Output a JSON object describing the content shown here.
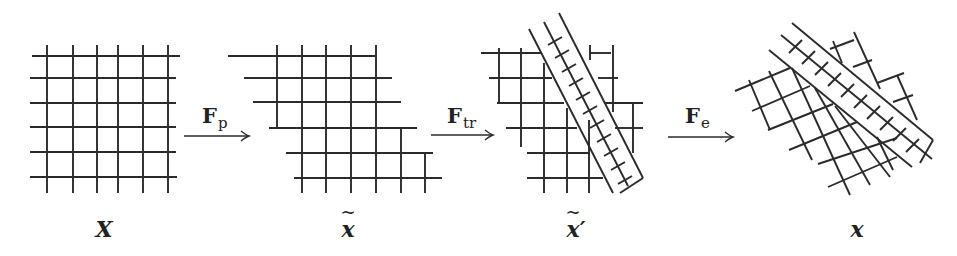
{
  "diagram": {
    "stroke_color": "#2b2b2b",
    "background": "#ffffff",
    "stages": [
      {
        "id": "X",
        "label": "X",
        "tilde": false,
        "prime": "",
        "label_pos": [
          104,
          216
        ],
        "lines": [
          [
            47,
            45,
            47,
            193
          ],
          [
            73,
            45,
            73,
            193
          ],
          [
            97,
            45,
            97,
            193
          ],
          [
            118,
            45,
            118,
            193
          ],
          [
            143,
            45,
            143,
            193
          ],
          [
            168,
            45,
            168,
            193
          ],
          [
            32,
            56,
            180,
            56
          ],
          [
            30,
            78,
            176,
            78
          ],
          [
            30,
            103,
            176,
            103
          ],
          [
            30,
            127,
            176,
            127
          ],
          [
            30,
            152,
            176,
            152
          ],
          [
            30,
            177,
            177,
            177
          ]
        ]
      },
      {
        "id": "x_tilde",
        "label": "x",
        "tilde": true,
        "prime": "",
        "label_pos": [
          348,
          216
        ],
        "lines": [
          [
            228,
            56,
            375,
            56
          ],
          [
            244,
            78,
            392,
            78
          ],
          [
            253,
            102,
            401,
            102
          ],
          [
            269,
            128,
            417,
            128
          ],
          [
            286,
            153,
            433,
            153
          ],
          [
            294,
            178,
            442,
            178
          ],
          [
            277,
            45,
            277,
            128
          ],
          [
            302,
            45,
            302,
            193
          ],
          [
            326,
            45,
            326,
            193
          ],
          [
            351,
            45,
            351,
            193
          ],
          [
            376,
            45,
            376,
            193
          ],
          [
            401,
            128,
            401,
            193
          ],
          [
            425,
            153,
            425,
            193
          ]
        ]
      },
      {
        "id": "x_tilde_prime",
        "label": "x",
        "tilde": true,
        "prime": "′",
        "label_pos": [
          576,
          216
        ],
        "lines": [
          [
            481,
            53,
            541,
            53
          ],
          [
            590,
            53,
            611,
            53
          ],
          [
            489,
            78,
            552,
            78
          ],
          [
            598,
            78,
            618,
            78
          ],
          [
            497,
            103,
            564,
            103
          ],
          [
            605,
            103,
            643,
            103
          ],
          [
            506,
            128,
            577,
            128
          ],
          [
            615,
            128,
            643,
            128
          ],
          [
            527,
            153,
            590,
            153
          ],
          [
            527,
            178,
            603,
            178
          ],
          [
            499,
            48,
            499,
            103
          ],
          [
            521,
            48,
            521,
            147
          ],
          [
            544,
            63,
            544,
            193
          ],
          [
            567,
            108,
            567,
            193
          ],
          [
            590,
            45,
            590,
            60
          ],
          [
            589,
            120,
            589,
            193
          ],
          [
            613,
            45,
            613,
            112
          ],
          [
            633,
            103,
            633,
            153
          ],
          [
            529,
            29,
            613,
            193
          ],
          [
            544,
            22,
            628,
            186
          ],
          [
            559,
            13,
            643,
            178
          ],
          [
            643,
            178,
            620,
            193
          ],
          [
            548,
            45,
            562,
            37
          ],
          [
            555,
            58,
            569,
            50
          ],
          [
            562,
            72,
            576,
            64
          ],
          [
            569,
            86,
            583,
            78
          ],
          [
            576,
            100,
            590,
            92
          ],
          [
            583,
            114,
            597,
            106
          ],
          [
            590,
            128,
            604,
            120
          ],
          [
            597,
            142,
            611,
            134
          ],
          [
            604,
            156,
            618,
            148
          ],
          [
            611,
            170,
            625,
            162
          ],
          [
            618,
            184,
            632,
            176
          ]
        ]
      },
      {
        "id": "x",
        "label": "x",
        "tilde": false,
        "prime": "",
        "label_pos": [
          857,
          216
        ],
        "lines": [
          [
            735,
            91,
            790,
            68
          ],
          [
            752,
            111,
            810,
            86
          ],
          [
            768,
            130,
            833,
            104
          ],
          [
            789,
            150,
            857,
            122
          ],
          [
            818,
            164,
            897,
            138
          ],
          [
            828,
            187,
            897,
            157
          ],
          [
            749,
            80,
            770,
            130
          ],
          [
            769,
            71,
            812,
            160
          ],
          [
            792,
            68,
            850,
            195
          ],
          [
            815,
            88,
            870,
            185
          ],
          [
            835,
            106,
            890,
            177
          ],
          [
            877,
            137,
            893,
            170
          ],
          [
            830,
            49,
            854,
            40
          ],
          [
            853,
            67,
            872,
            60
          ],
          [
            854,
            32,
            880,
            89
          ],
          [
            833,
            41,
            842,
            63
          ],
          [
            877,
            83,
            904,
            73
          ],
          [
            897,
            75,
            917,
            120
          ],
          [
            893,
            102,
            913,
            95
          ],
          [
            792,
            23,
            933,
            140
          ],
          [
            781,
            35,
            932,
            159
          ],
          [
            769,
            50,
            912,
            167
          ],
          [
            933,
            140,
            920,
            163
          ],
          [
            789,
            53,
            802,
            40
          ],
          [
            802,
            64,
            815,
            51
          ],
          [
            815,
            75,
            828,
            62
          ],
          [
            828,
            86,
            841,
            73
          ],
          [
            841,
            97,
            854,
            84
          ],
          [
            854,
            108,
            867,
            95
          ],
          [
            867,
            119,
            880,
            106
          ],
          [
            880,
            130,
            893,
            117
          ],
          [
            893,
            141,
            906,
            128
          ],
          [
            906,
            152,
            919,
            139
          ]
        ]
      }
    ],
    "operators": [
      {
        "id": "F_p",
        "symbol": "F",
        "subscript": "p",
        "label_pos": [
          202,
          103
        ],
        "arrow": [
          184,
          136,
          249,
          136
        ]
      },
      {
        "id": "F_tr",
        "symbol": "F",
        "subscript": "tr",
        "label_pos": [
          447,
          103
        ],
        "arrow": [
          431,
          135,
          493,
          135
        ]
      },
      {
        "id": "F_e",
        "symbol": "F",
        "subscript": "e",
        "label_pos": [
          685,
          103
        ],
        "arrow": [
          668,
          137,
          733,
          137
        ]
      }
    ]
  }
}
